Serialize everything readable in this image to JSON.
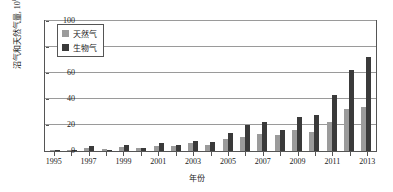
{
  "chart_data": {
    "type": "bar",
    "title": "",
    "xlabel": "年份",
    "ylabel": "沼气和天然气量, 10⁸m³",
    "ylabel_text": "沼气和天然气量, 10",
    "ylabel_exp": "8",
    "ylabel_unit": "m",
    "ylabel_unit_exp": "3",
    "ylim": [
      0,
      100
    ],
    "yticks": [
      0,
      20,
      40,
      60,
      80,
      100
    ],
    "grid": true,
    "legend_position": "top-left",
    "categories": [
      "1995",
      "1996",
      "1997",
      "1998",
      "1999",
      "2000",
      "2001",
      "2002",
      "2003",
      "2004",
      "2005",
      "2006",
      "2007",
      "2008",
      "2009",
      "2010",
      "2011",
      "2012",
      "2013"
    ],
    "xtick_labels": [
      "1995",
      "",
      "1997",
      "",
      "1999",
      "",
      "2001",
      "",
      "2003",
      "",
      "2005",
      "",
      "2007",
      "",
      "2009",
      "",
      "2011",
      "",
      "2013"
    ],
    "series": [
      {
        "name": "天然气",
        "color": "#9b9b9b",
        "values": [
          0.5,
          1.0,
          2.0,
          1.5,
          3.0,
          2.5,
          4.0,
          3.5,
          6.0,
          5.0,
          9.0,
          11.0,
          13.0,
          12.0,
          16.0,
          15.0,
          22.0,
          32.0,
          34.0
        ]
      },
      {
        "name": "生物气",
        "color": "#3a3a3a",
        "values": [
          0.3,
          0.8,
          3.5,
          1.0,
          5.0,
          2.0,
          6.0,
          4.5,
          8.0,
          7.0,
          14.0,
          20.0,
          22.0,
          16.0,
          26.0,
          28.0,
          43.0,
          62.0,
          72.0
        ]
      }
    ]
  }
}
